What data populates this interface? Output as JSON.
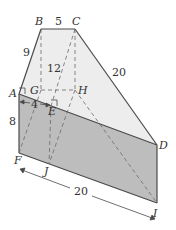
{
  "figure": {
    "vertices": {
      "A": "A",
      "B": "B",
      "C": "C",
      "D": "D",
      "E": "E",
      "F": "F",
      "G": "G",
      "H": "H",
      "I": "I",
      "J": "J"
    },
    "measures": {
      "BC": "5",
      "AB": "9",
      "height": "12",
      "CD": "20",
      "AE": "4",
      "AF": "8",
      "FI": "20"
    },
    "colors": {
      "top_face": "#ededed",
      "front_face": "#bdbdbd",
      "edge": "#4a4a4a",
      "hidden": "#6a6a6a"
    }
  }
}
